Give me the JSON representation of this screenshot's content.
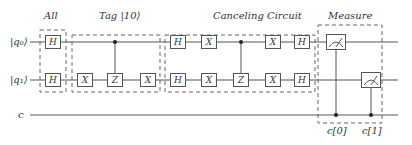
{
  "diagram": {
    "type": "quantum-circuit",
    "qubits": [
      "|q₀⟩",
      "|q₁⟩"
    ],
    "classical": "c",
    "sections": [
      {
        "label": "All",
        "gates": {
          "q0": [
            "H"
          ],
          "q1": [
            "H"
          ]
        }
      },
      {
        "label": "Tag |10⟩",
        "gates": {
          "q0": [
            "•(control)"
          ],
          "q1": [
            "X",
            "Z",
            "X"
          ]
        }
      },
      {
        "label": "Canceling Circuit",
        "gates": {
          "q0": [
            "H",
            "X",
            "•(control)",
            "X",
            "H"
          ],
          "q1": [
            "H",
            "X",
            "Z",
            "X",
            "H"
          ]
        }
      },
      {
        "label": "Measure",
        "gates": {
          "q0": [
            "measure→c[0]"
          ],
          "q1": [
            "measure→c[1]"
          ]
        }
      }
    ],
    "gate_labels": {
      "H": "H",
      "X": "X",
      "Z": "Z"
    },
    "classical_bits": [
      "c[0]",
      "c[1]"
    ]
  },
  "colors": {
    "line": "#555555",
    "dash": "#666666",
    "text": "#333333"
  }
}
